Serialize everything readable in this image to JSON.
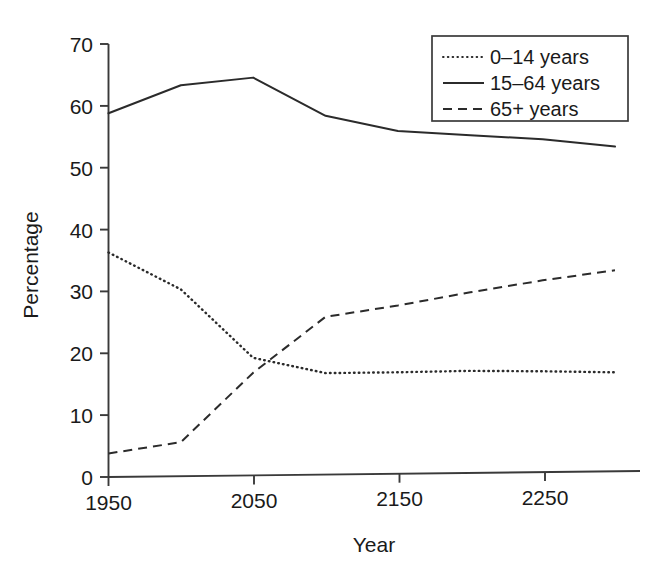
{
  "chart_data": {
    "type": "line",
    "title": "",
    "xlabel": "Year",
    "ylabel": "Percentage",
    "xlim": [
      1950,
      2300
    ],
    "ylim": [
      0,
      70
    ],
    "xticks": [
      1950,
      2050,
      2150,
      2250
    ],
    "yticks": [
      0,
      10,
      20,
      30,
      40,
      50,
      60,
      70
    ],
    "grid": false,
    "legend_position": "top-right",
    "x": [
      1950,
      2000,
      2050,
      2100,
      2150,
      2200,
      2250,
      2300
    ],
    "series": [
      {
        "name": "0–14 years",
        "style": "dotted",
        "values": [
          36.3,
          30.2,
          19.0,
          16.4,
          16.4,
          16.5,
          16.3,
          16.0
        ]
      },
      {
        "name": "15–64 years",
        "style": "solid",
        "values": [
          58.8,
          63.2,
          64.3,
          58.0,
          55.4,
          54.6,
          53.8,
          52.5
        ]
      },
      {
        "name": "65+ years",
        "style": "dashed",
        "values": [
          3.8,
          5.5,
          16.6,
          25.5,
          27.2,
          29.2,
          31.0,
          32.5
        ]
      }
    ],
    "legend": [
      {
        "label": "0–14 years",
        "style": "dotted"
      },
      {
        "label": "15–64 years",
        "style": "solid"
      },
      {
        "label": "65+ years",
        "style": "dashed"
      }
    ]
  },
  "axes": {
    "y_title": "Percentage",
    "x_title": "Year",
    "y_tick_labels": [
      "0",
      "10",
      "20",
      "30",
      "40",
      "50",
      "60",
      "70"
    ],
    "x_tick_labels": [
      "1950",
      "2050",
      "2150",
      "2250"
    ]
  },
  "colors": {
    "ink": "#2b2b2b",
    "axis": "#3a3a3a",
    "background": "#ffffff"
  }
}
